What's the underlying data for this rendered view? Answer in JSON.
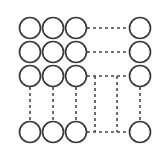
{
  "diagram": {
    "type": "node-link-graph",
    "canvas": {
      "width": 157,
      "height": 157,
      "background": "#ffffff"
    },
    "style": {
      "node_stroke_color": "#3a3a3a",
      "node_fill_color": "#ffffff",
      "node_stroke_width": 1.7,
      "node_radius": 10.5,
      "edge_stroke_color": "#4a4a4a",
      "edge_stroke_width": 1.6,
      "edge_dash_pattern": "3 3"
    },
    "grid": {
      "column_x": [
        30,
        53,
        76,
        140
      ],
      "row_y": [
        28,
        52,
        76,
        132
      ],
      "free_column_x": [
        95,
        117
      ]
    },
    "nodes": [
      {
        "id": "r1c1",
        "label": "",
        "cx": 30,
        "cy": 28
      },
      {
        "id": "r1c2",
        "label": "",
        "cx": 53,
        "cy": 28
      },
      {
        "id": "r1c3",
        "label": "",
        "cx": 76,
        "cy": 28
      },
      {
        "id": "r1c4",
        "label": "",
        "cx": 140,
        "cy": 28
      },
      {
        "id": "r2c1",
        "label": "",
        "cx": 30,
        "cy": 52
      },
      {
        "id": "r2c2",
        "label": "",
        "cx": 53,
        "cy": 52
      },
      {
        "id": "r2c3",
        "label": "",
        "cx": 76,
        "cy": 52
      },
      {
        "id": "r2c4",
        "label": "",
        "cx": 140,
        "cy": 52
      },
      {
        "id": "r3c1",
        "label": "",
        "cx": 30,
        "cy": 76
      },
      {
        "id": "r3c2",
        "label": "",
        "cx": 53,
        "cy": 76
      },
      {
        "id": "r3c3",
        "label": "",
        "cx": 76,
        "cy": 76
      },
      {
        "id": "r3c4",
        "label": "",
        "cx": 140,
        "cy": 76
      },
      {
        "id": "r4c1",
        "label": "",
        "cx": 30,
        "cy": 132
      },
      {
        "id": "r4c2",
        "label": "",
        "cx": 53,
        "cy": 132
      },
      {
        "id": "r4c3",
        "label": "",
        "cx": 76,
        "cy": 132
      },
      {
        "id": "r4c4",
        "label": "",
        "cx": 140,
        "cy": 132
      }
    ],
    "edges": [
      {
        "id": "e-r1-h",
        "orientation": "horizontal",
        "from": "r1c3",
        "to": "r1c4",
        "x1": 87,
        "y1": 28,
        "x2": 129,
        "y2": 28
      },
      {
        "id": "e-r2-h",
        "orientation": "horizontal",
        "from": "r2c3",
        "to": "r2c4",
        "x1": 87,
        "y1": 52,
        "x2": 129,
        "y2": 52
      },
      {
        "id": "e-r3-h",
        "orientation": "horizontal",
        "from": "r3c3",
        "to": "r3c4",
        "x1": 87,
        "y1": 76,
        "x2": 129,
        "y2": 76
      },
      {
        "id": "e-r4-h",
        "orientation": "horizontal",
        "from": "r4c3",
        "to": "r4c4",
        "x1": 87,
        "y1": 132,
        "x2": 129,
        "y2": 132
      },
      {
        "id": "e-c1-v",
        "orientation": "vertical",
        "from": "r3c1",
        "to": "r4c1",
        "x1": 30,
        "y1": 87,
        "x2": 30,
        "y2": 121
      },
      {
        "id": "e-c2-v",
        "orientation": "vertical",
        "from": "r3c2",
        "to": "r4c2",
        "x1": 53,
        "y1": 87,
        "x2": 53,
        "y2": 121
      },
      {
        "id": "e-c3-v",
        "orientation": "vertical",
        "from": "r3c3",
        "to": "r4c3",
        "x1": 76,
        "y1": 87,
        "x2": 76,
        "y2": 121
      },
      {
        "id": "e-c4-v",
        "orientation": "vertical",
        "from": "r3c4",
        "to": "r4c4",
        "x1": 140,
        "y1": 87,
        "x2": 140,
        "y2": 121
      },
      {
        "id": "e-f1-v",
        "orientation": "vertical",
        "from": "e-r3-h",
        "to": "e-r4-h",
        "x1": 95,
        "y1": 76,
        "x2": 95,
        "y2": 132
      },
      {
        "id": "e-f2-v",
        "orientation": "vertical",
        "from": "e-r3-h",
        "to": "e-r4-h",
        "x1": 117,
        "y1": 76,
        "x2": 117,
        "y2": 132
      }
    ]
  }
}
